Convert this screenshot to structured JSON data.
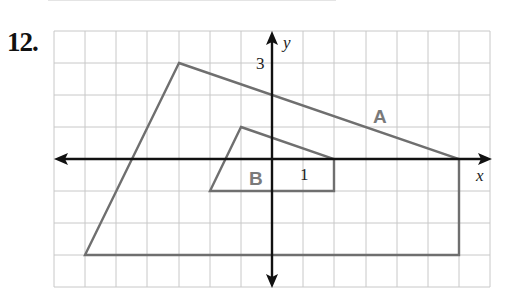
{
  "problem": {
    "number": "12."
  },
  "graph": {
    "grid": {
      "x_min": -7,
      "x_max": 7,
      "y_min": -4,
      "y_max": 4,
      "cell_px_x": 31.15,
      "cell_px_y": 32,
      "origin_px": [
        272,
        159
      ]
    },
    "axes": {
      "x_label": "x",
      "y_label": "y",
      "tick_labels": [
        {
          "axis": "y",
          "value": "3"
        },
        {
          "axis": "x",
          "value": "1"
        }
      ]
    },
    "colors": {
      "grid": "#c8c8c8",
      "axes": "#111111",
      "shapes": "#6f6f6f",
      "shape_labels": "#7a7a7a"
    },
    "shapes": [
      {
        "name": "A",
        "label": "A",
        "vertices": [
          [
            -3,
            3
          ],
          [
            6,
            0
          ],
          [
            6,
            -3
          ],
          [
            -6,
            -3
          ]
        ]
      },
      {
        "name": "B",
        "label": "B",
        "vertices": [
          [
            -1,
            1
          ],
          [
            2,
            0
          ],
          [
            2,
            -1
          ],
          [
            -2,
            -1
          ]
        ]
      }
    ]
  }
}
